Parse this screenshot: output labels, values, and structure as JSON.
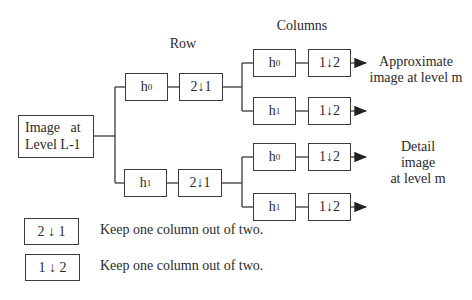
{
  "headers": {
    "row": "Row",
    "columns": "Columns"
  },
  "input_block": {
    "line1": "Image   at",
    "line2": "Level L-1"
  },
  "row_stage": {
    "branches": [
      {
        "filter": "h",
        "filter_sub": "0",
        "downsampler": "2↓1"
      },
      {
        "filter": "h",
        "filter_sub": "1",
        "downsampler": "2↓1"
      }
    ]
  },
  "column_stage": {
    "branches": [
      {
        "filter": "h",
        "filter_sub": "0",
        "downsampler": "1↓2"
      },
      {
        "filter": "h",
        "filter_sub": "1",
        "downsampler": "1↓2"
      },
      {
        "filter": "h",
        "filter_sub": "0",
        "downsampler": "1↓2"
      },
      {
        "filter": "h",
        "filter_sub": "1",
        "downsampler": "1↓2"
      }
    ]
  },
  "outputs": {
    "approx": {
      "line1": "Approximate",
      "line2": "image at level m"
    },
    "detail": {
      "line1": "Detail",
      "line2": "image",
      "line3": "at level m"
    }
  },
  "legend": [
    {
      "symbol": "2 ↓ 1",
      "description": "Keep one column out of two."
    },
    {
      "symbol": "1 ↓ 2",
      "description": "Keep one column out of two."
    }
  ]
}
